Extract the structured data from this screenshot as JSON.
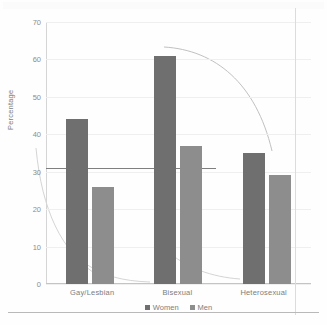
{
  "page": {
    "ghost_text_top": "",
    "background_color": "#fefefe"
  },
  "chart_data": {
    "type": "bar",
    "title": "",
    "subtitle": "",
    "xlabel": "",
    "ylabel": "Percentage",
    "categories": [
      "Gay/Lesbian",
      "Bisexual",
      "Heterosexual"
    ],
    "series": [
      {
        "name": "Women",
        "values": [
          44,
          61,
          35
        ],
        "color": "#6f6f6f"
      },
      {
        "name": "Men",
        "values": [
          26,
          37,
          29
        ],
        "color": "#8d8d8d"
      }
    ],
    "ylim": [
      0,
      70
    ],
    "yticks": [
      0,
      10,
      20,
      30,
      40,
      50,
      60,
      70
    ],
    "ytick_labels": [
      "0",
      "10",
      "20",
      "30",
      "40",
      "50",
      "60",
      "70"
    ],
    "grid": true,
    "legend_position": "bottom",
    "annotations": [
      {
        "name": "reference-line",
        "type": "hline",
        "value": 31
      }
    ]
  },
  "legend": {
    "entries": [
      {
        "label": "Women",
        "color": "#6f6f6f"
      },
      {
        "label": "Men",
        "color": "#8d8d8d"
      }
    ]
  },
  "axis": {
    "y_title": "Percentage",
    "y_ticks": [
      "0",
      "10",
      "20",
      "30",
      "40",
      "50",
      "60",
      "70"
    ],
    "x_ticks": [
      "Gay/Lesbian",
      "Bisexual",
      "Heterosexual"
    ]
  }
}
